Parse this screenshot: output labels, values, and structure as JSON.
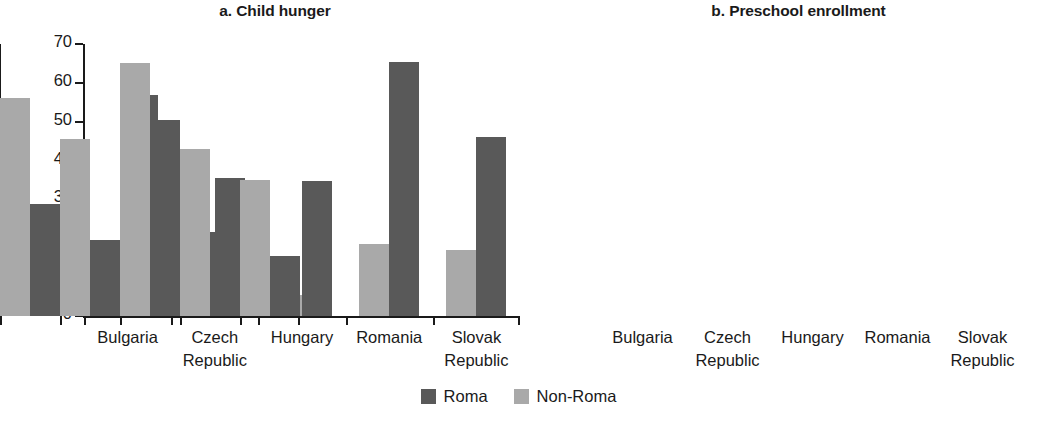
{
  "legend": {
    "position": "bottom-center",
    "entries": [
      {
        "label": "Roma",
        "color": "#595959"
      },
      {
        "label": "Non-Roma",
        "color": "#a9a9a9"
      }
    ]
  },
  "chart_data": [
    {
      "type": "bar",
      "title": "a. Child hunger",
      "xlabel": "",
      "ylabel": "Percent",
      "ylim": [
        0,
        70
      ],
      "yticks": [
        0,
        10,
        20,
        30,
        40,
        50,
        60,
        70
      ],
      "ytick_labels": [
        "0",
        "10",
        "20",
        "30",
        "40",
        "50",
        "60",
        "70"
      ],
      "grid": false,
      "categories": [
        "Bulgaria",
        "Czech\nRepublic",
        "Hungary",
        "Romania",
        "Slovak\nRepublic"
      ],
      "bar_order": [
        "Non-Roma",
        "Roma"
      ],
      "series": [
        {
          "name": "Non-Roma",
          "color": "#a9a9a9",
          "values": [
            13.5,
            7.5,
            5.5,
            18.5,
            17.0
          ]
        },
        {
          "name": "Roma",
          "color": "#595959",
          "values": [
            57.0,
            35.5,
            34.8,
            65.5,
            46.0
          ]
        }
      ]
    },
    {
      "type": "bar",
      "title": "b. Preschool enrollment",
      "xlabel": "",
      "ylabel": "Percent",
      "ylim": [
        0,
        100
      ],
      "yticks": [
        0,
        20,
        40,
        60,
        80,
        100
      ],
      "ytick_labels": [
        "0",
        "20",
        "40",
        "60",
        "80",
        "100"
      ],
      "grid": false,
      "categories": [
        "Bulgaria",
        "Czech\nRepublic",
        "Hungary",
        "Romania",
        "Slovak\nRepublic"
      ],
      "bar_order": [
        "Non-Roma",
        "Roma"
      ],
      "series": [
        {
          "name": "Non-Roma",
          "color": "#a9a9a9",
          "values": [
            80.0,
            65.0,
            93.0,
            61.5,
            50.0
          ]
        },
        {
          "name": "Roma",
          "color": "#595959",
          "values": [
            41.0,
            28.0,
            72.0,
            31.0,
            22.0
          ]
        }
      ]
    }
  ]
}
